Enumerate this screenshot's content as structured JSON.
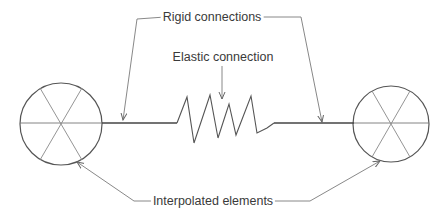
{
  "labels": {
    "rigid": "Rigid connections",
    "elastic": "Elastic connection",
    "interpolated": "Interpolated elements"
  },
  "colors": {
    "stroke": "#555555",
    "leader": "#7a7a7a",
    "text": "#3a3a3a",
    "background": "#ffffff"
  },
  "elements": {
    "left_node": {
      "cx": 61,
      "cy": 124,
      "r": 41,
      "kind": "interpolated-element"
    },
    "right_node": {
      "cx": 391,
      "cy": 124,
      "r": 38,
      "kind": "interpolated-element"
    },
    "rigid_left": {
      "x1": 102,
      "x2": 177,
      "y": 123
    },
    "rigid_right": {
      "x1": 274,
      "x2": 354,
      "y": 123
    },
    "spring": {
      "x1": 177,
      "x2": 274,
      "coils": 4
    }
  }
}
